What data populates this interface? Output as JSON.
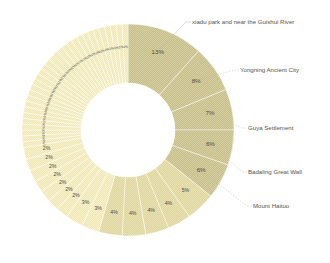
{
  "chart_data": {
    "type": "pie",
    "variant": "donut",
    "title": "",
    "subtitle": "",
    "xlabel": "",
    "ylabel": "",
    "legend_position": "callout-right",
    "grid": false,
    "value_suffix": "%",
    "start_angle_deg": -90,
    "direction": "clockwise",
    "inner_radius_ratio": 0.44,
    "palette": {
      "dark_fill": "#c6bf8d",
      "light_fill": "#efe7b5",
      "mid_fill": "#ded59f",
      "slice_border": "#ffffff",
      "label_text": "#4a4a44",
      "callout_text": "#55554e",
      "leader_line": "#b9b9b2",
      "background": "#ffffff"
    },
    "callouts": [
      {
        "label": "xiadu park and near the Guishui River",
        "value": 13
      },
      {
        "label": "Yongning Ancient City",
        "value": 8
      },
      {
        "label": "Guya Settlement",
        "value": 7
      },
      {
        "label": "Badaling Great Wall",
        "value": 6
      },
      {
        "label": "Mount Haituo",
        "value": 6
      }
    ],
    "categories": [
      "xiadu park and near the Guishui River",
      "Yongning Ancient City",
      "Guya Settlement",
      "Badaling Great Wall",
      "Mount Haituo",
      "slice-6",
      "slice-7",
      "slice-8",
      "slice-9",
      "slice-10",
      "slice-11",
      "slice-12",
      "slice-13",
      "slice-14",
      "slice-15",
      "slice-16",
      "slice-17",
      "slice-18",
      "slice-19",
      "slice-20",
      "slice-21",
      "slice-22",
      "slice-23",
      "slice-24",
      "slice-25",
      "slice-26",
      "slice-27",
      "slice-28",
      "slice-29",
      "slice-30",
      "slice-31",
      "slice-32",
      "slice-33",
      "slice-34",
      "slice-35",
      "slice-36",
      "slice-37",
      "slice-38",
      "slice-39",
      "slice-40",
      "slice-41",
      "slice-42",
      "slice-43",
      "slice-44",
      "slice-45",
      "slice-46",
      "slice-47",
      "slice-48",
      "slice-49",
      "slice-50"
    ],
    "values": [
      13,
      8,
      7,
      6,
      6,
      5,
      4,
      4,
      4,
      4,
      3,
      3,
      2,
      2,
      2,
      2,
      2,
      2,
      2,
      1,
      1,
      1,
      1,
      1,
      1,
      1,
      1,
      1,
      1,
      1,
      1,
      1,
      1,
      1,
      1,
      1,
      1,
      1,
      1,
      1,
      1,
      1,
      1,
      1,
      1,
      1,
      1,
      1,
      1,
      1
    ],
    "value_labels": [
      "13%",
      "8%",
      "7%",
      "6%",
      "6%",
      "5%",
      "4%",
      "4%",
      "4%",
      "4%",
      "3%",
      "3%",
      "2%",
      "2%",
      "2%",
      "2%",
      "2%",
      "2%",
      "2%",
      "1%",
      "1%",
      "1%",
      "1%",
      "1%",
      "1%",
      "1%",
      "1%",
      "1%",
      "1%",
      "1%",
      "1%",
      "1%",
      "1%",
      "1%",
      "1%",
      "1%",
      "1%",
      "1%",
      "1%",
      "1%",
      "1%",
      "1%",
      "1%",
      "1%",
      "1%",
      "1%",
      "1%",
      "1%",
      "1%",
      "1%"
    ]
  },
  "geometry": {
    "cx": 128,
    "cy": 130,
    "outer_r": 106,
    "inner_r": 47
  }
}
